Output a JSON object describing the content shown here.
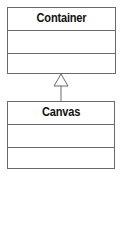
{
  "diagram": {
    "type": "uml-class-inheritance",
    "classes": [
      {
        "name": "Container",
        "attributes": [],
        "operations": []
      },
      {
        "name": "Canvas",
        "attributes": [],
        "operations": []
      }
    ],
    "relationships": [
      {
        "type": "generalization",
        "from": "Canvas",
        "to": "Container"
      }
    ],
    "colors": {
      "line": "#6a6a6a",
      "text": "#111111",
      "background": "#ffffff"
    }
  }
}
